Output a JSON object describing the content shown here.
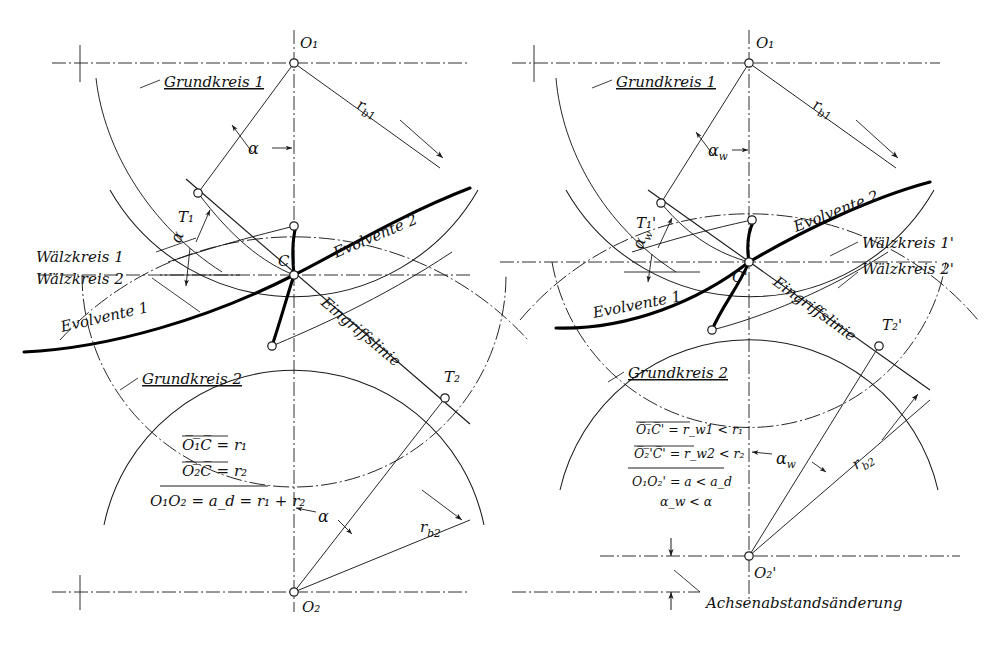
{
  "figure": {
    "background_color": "#ffffff",
    "ink_color": "#1a1a1a",
    "thick_curve_color": "#000000"
  },
  "left_diagram": {
    "name": "Nennachsabstand",
    "points": {
      "O1": "O₁",
      "O2": "O₂",
      "C": "C",
      "T1": "T₁",
      "T2": "T₂"
    },
    "labels": {
      "grundkreis1": "Grundkreis 1",
      "grundkreis2": "Grundkreis 2",
      "waelzkreis1": "Wälzkreis 1",
      "waelzkreis2": "Wälzkreis 2",
      "evolvente1": "Evolvente 1",
      "evolvente2": "Evolvente 2",
      "eingriffslinie": "Eingriffslinie",
      "rb1": "r",
      "rb1_sub": "b1",
      "rb2": "r",
      "rb2_sub": "b2",
      "alpha_top": "α",
      "alpha_t1": "α",
      "alpha_bottom": "α"
    },
    "formulas": [
      {
        "lhs": "O₁C",
        "overline": true,
        "rhs": "= r₁"
      },
      {
        "lhs": "O₂C",
        "overline": true,
        "rhs": "= r₂"
      },
      {
        "lhs": "O₁O₂",
        "overline": false,
        "rhs": "= a_d = r₁ + r₂"
      }
    ],
    "formula_lines": [
      "O̅₁̅C̅ = r₁",
      "O̅₂̅C̅ = r₂",
      "O₁O₂ = a_d = r₁ + r₂"
    ]
  },
  "right_diagram": {
    "name": "Achsabstandsänderung",
    "points": {
      "O1": "O₁",
      "O2p": "O₂'",
      "Cp": "C'",
      "T1p": "T₁'",
      "T2p": "T₂'"
    },
    "labels": {
      "grundkreis1": "Grundkreis 1",
      "grundkreis2": "Grundkreis 2",
      "waelzkreis1p": "Wälzkreis 1'",
      "waelzkreis2p": "Wälzkreis 2'",
      "evolvente1": "Evolvente 1",
      "evolvente2": "Evolvente 2",
      "eingriffslinie": "Eingriffslinie",
      "rb1": "r",
      "rb1_sub": "b1",
      "rb2": "r",
      "rb2_sub": "b2",
      "alpha_w_top": "α",
      "alpha_w_sub": "w",
      "alpha_w_t1": "α",
      "alpha_w_bottom": "α",
      "achsenabstandsaenderung": "Achsenabstandsänderung"
    },
    "formula_lines": [
      "O̅₁̅C̅' = r_w1 < r₁",
      "O̅₂̅'C̅' = r_w2 < r₂",
      "O₁O₂' = a < a_d",
      "α_w < α"
    ]
  }
}
